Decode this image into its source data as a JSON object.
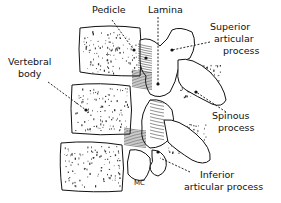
{
  "diagram": {
    "labels": {
      "pedicle": "Pedicle",
      "lamina": "Lamina",
      "superior_articular_1": "Superior",
      "superior_articular_2": "articular",
      "superior_articular_3": "process",
      "vertebral_body_1": "Vertebral",
      "vertebral_body_2": "body",
      "spinous_1": "Spinous",
      "spinous_2": "process",
      "inferior_articular_1": "Inferior",
      "inferior_articular_2": "articular process",
      "signature": "MC"
    }
  }
}
